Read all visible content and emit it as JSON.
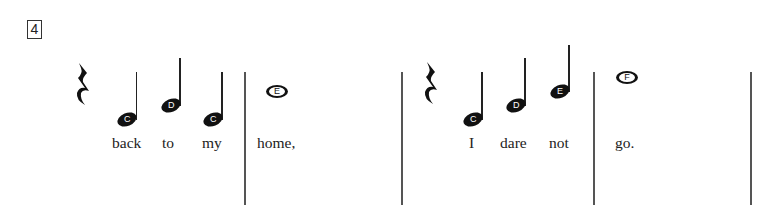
{
  "exercise": {
    "number": "4",
    "measures": [
      {
        "index": 1,
        "rest": "quarter-rest",
        "notes": [
          {
            "letter": "C",
            "type": "half",
            "lyric": "back"
          },
          {
            "letter": "D",
            "type": "half",
            "lyric": "to"
          },
          {
            "letter": "C",
            "type": "half",
            "lyric": "my"
          }
        ]
      },
      {
        "index": 2,
        "notes": [
          {
            "letter": "E",
            "type": "whole",
            "lyric": "home,"
          }
        ]
      },
      {
        "index": 3,
        "rest": "quarter-rest",
        "notes": [
          {
            "letter": "C",
            "type": "half",
            "lyric": "I"
          },
          {
            "letter": "D",
            "type": "half",
            "lyric": "dare"
          },
          {
            "letter": "E",
            "type": "half",
            "lyric": "not"
          }
        ]
      },
      {
        "index": 4,
        "notes": [
          {
            "letter": "F",
            "type": "whole",
            "lyric": "go."
          }
        ]
      }
    ]
  },
  "colors": {
    "ink": "#111111",
    "barline": "#555555",
    "background": "#ffffff"
  }
}
